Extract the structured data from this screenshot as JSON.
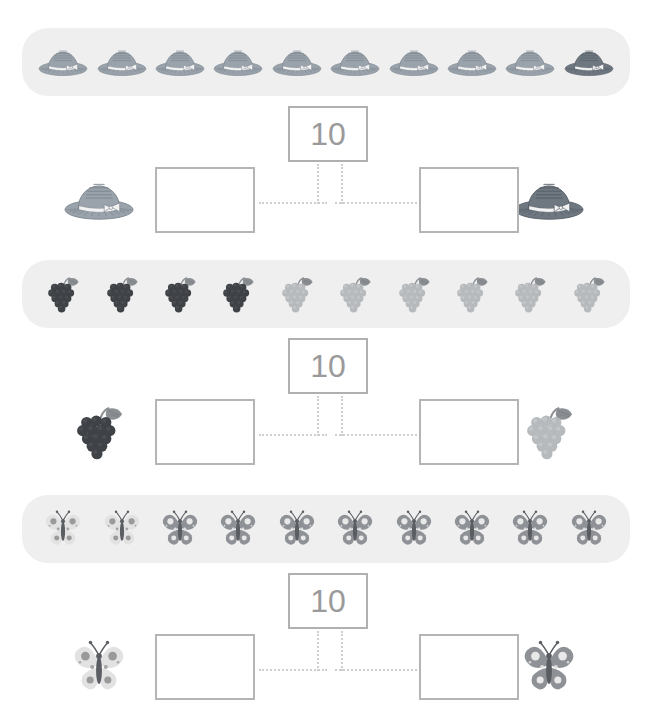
{
  "worksheet": {
    "title_partial": "",
    "whole_value": "10",
    "background": "#ffffff",
    "strip_background": "#efefef",
    "box_border_color": "#b5b5b5",
    "whole_text_color": "#9a9a9a",
    "connector_color": "#cfcfcf"
  },
  "palette": {
    "hat_light": "#9aa3ac",
    "hat_light_dark": "#7d868f",
    "hat_dark": "#6f7881",
    "hat_dark_dark": "#565e66",
    "hat_band": "#f2f2f2",
    "grape_dark": "#3f4246",
    "grape_dark_hi": "#55585d",
    "grape_light": "#b7babd",
    "grape_light_hi": "#cdd0d3",
    "grape_leaf": "#8b8f93",
    "butterfly_light": "#e2e2e2",
    "butterfly_light_spot": "#9a9a9a",
    "butterfly_dark": "#8e9196",
    "butterfly_dark_spot": "#e8e8e8",
    "butterfly_body": "#5a5d62"
  },
  "exercises": [
    {
      "name": "hats",
      "item_icon": "hat-icon",
      "total": 10,
      "strip_items": [
        "light",
        "light",
        "light",
        "light",
        "light",
        "light",
        "light",
        "light",
        "light",
        "dark"
      ],
      "left_part": {
        "icon": "hat-icon",
        "shade": "light",
        "value": ""
      },
      "right_part": {
        "icon": "hat-icon",
        "shade": "dark",
        "value": ""
      },
      "whole": "10"
    },
    {
      "name": "grapes",
      "item_icon": "grapes-icon",
      "total": 10,
      "strip_items": [
        "dark",
        "dark",
        "dark",
        "dark",
        "light",
        "light",
        "light",
        "light",
        "light",
        "light"
      ],
      "left_part": {
        "icon": "grapes-icon",
        "shade": "dark",
        "value": ""
      },
      "right_part": {
        "icon": "grapes-icon",
        "shade": "light",
        "value": ""
      },
      "whole": "10"
    },
    {
      "name": "butterflies",
      "item_icon": "butterfly-icon",
      "total": 10,
      "strip_items": [
        "light",
        "light",
        "dark",
        "dark",
        "dark",
        "dark",
        "dark",
        "dark",
        "dark",
        "dark"
      ],
      "left_part": {
        "icon": "butterfly-icon",
        "shade": "light",
        "value": ""
      },
      "right_part": {
        "icon": "butterfly-icon",
        "shade": "dark",
        "value": ""
      },
      "whole": "10"
    }
  ]
}
